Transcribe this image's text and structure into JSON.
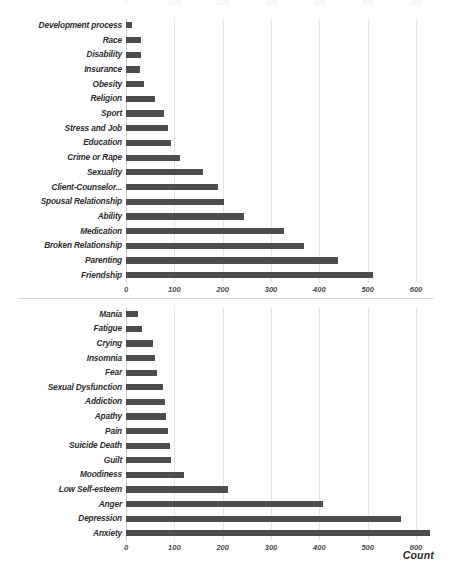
{
  "colors": {
    "bar": "#4d4d4d",
    "gridline": "#e4e4e4",
    "axis": "#d0d0d0",
    "text": "#2d2d2d",
    "background": "#ffffff"
  },
  "axis_title": "Count",
  "chart_data": [
    {
      "type": "bar",
      "orientation": "horizontal",
      "title": "",
      "xlabel": "",
      "ylabel": "",
      "xlim": [
        0,
        650
      ],
      "grid": true,
      "legend": "none",
      "xticks": [
        0,
        100,
        200,
        300,
        400,
        500,
        600
      ],
      "xtick_labels": [
        "0",
        "100",
        "200",
        "300",
        "400",
        "500",
        "600"
      ],
      "categories": [
        "Development process",
        "Race",
        "Disability",
        "Insurance",
        "Obesity",
        "Religion",
        "Sport",
        "Stress and Job",
        "Education",
        "Crime or Rape",
        "Sexuality",
        "Client-Counselor...",
        "Spousal Relationship",
        "Ability",
        "Medication",
        "Broken Relationship",
        "Parenting",
        "Friendship"
      ],
      "values": [
        12,
        30,
        31,
        28,
        37,
        60,
        79,
        86,
        93,
        112,
        159,
        190,
        203,
        244,
        327,
        369,
        439,
        511
      ]
    },
    {
      "type": "bar",
      "orientation": "horizontal",
      "title": "",
      "xlabel": "Count",
      "ylabel": "",
      "xlim": [
        0,
        650
      ],
      "grid": true,
      "legend": "none",
      "xticks": [
        0,
        100,
        200,
        300,
        400,
        500,
        600
      ],
      "xtick_labels": [
        "0",
        "100",
        "200",
        "300",
        "400",
        "500",
        "600"
      ],
      "categories": [
        "Mania",
        "Fatigue",
        "Crying",
        "Insomnia",
        "Fear",
        "Sexual Dysfunction",
        "Addiction",
        "Apathy",
        "Pain",
        "Suicide Death",
        "Guilt",
        "Moodiness",
        "Low Self-esteem",
        "Anger",
        "Depression",
        "Anxiety"
      ],
      "values": [
        24,
        34,
        55,
        60,
        65,
        76,
        80,
        83,
        86,
        90,
        93,
        119,
        211,
        408,
        569,
        629
      ]
    }
  ]
}
